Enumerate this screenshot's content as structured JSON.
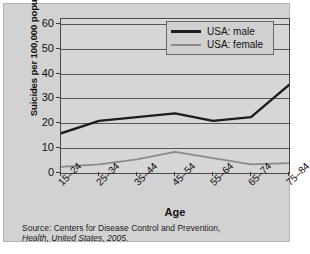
{
  "chart_data": {
    "type": "line",
    "title": "",
    "xlabel": "Age",
    "ylabel": "Suicides per 100,000 population",
    "categories": [
      "15–24",
      "25–34",
      "35–44",
      "45–54",
      "55–64",
      "65–74",
      "75–84"
    ],
    "series": [
      {
        "name": "USA: male",
        "color": "#1d1d1d",
        "values": [
          16,
          21,
          22.5,
          24,
          21,
          22.5,
          35.5
        ]
      },
      {
        "name": "USA: female",
        "color": "#8a8a8a",
        "values": [
          2.5,
          3.5,
          5.5,
          8.5,
          6,
          3.5,
          4
        ]
      }
    ],
    "yticks": [
      0,
      10,
      20,
      30,
      40,
      50,
      60
    ],
    "ylim": [
      0,
      62
    ],
    "grid": true,
    "legend_position": "top-right"
  },
  "axes": {
    "y_label": "Suicides per 100,000 population",
    "x_label": "Age"
  },
  "legend": {
    "entries": [
      {
        "label": "USA: male"
      },
      {
        "label": "USA: female"
      }
    ]
  },
  "source": {
    "line1": "Source: Centers for Disease Control and Prevention,",
    "line2": "Health, United States, 2005."
  },
  "colors": {
    "male_line": "#1d1d1d",
    "female_line": "#8a8a8a",
    "figure_background": "#d2d2d2",
    "plot_background": "#d6d6d6",
    "gridline": "#55565a",
    "axis": "#4a4a4a"
  }
}
